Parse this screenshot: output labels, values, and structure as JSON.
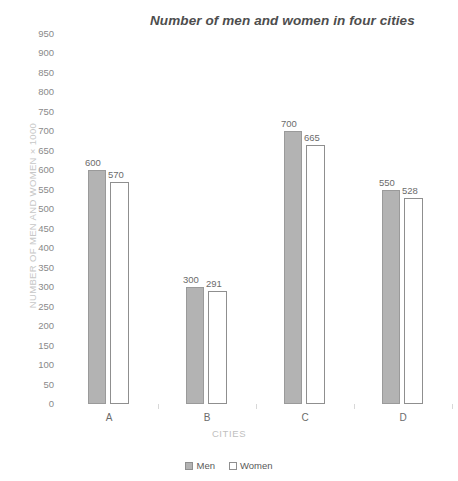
{
  "chart_data": {
    "type": "bar",
    "title": "Number of men and women in four cities",
    "xlabel": "CITIES",
    "ylabel": "NUMBER OF MEN AND WOMEN × 1000",
    "categories": [
      "A",
      "B",
      "C",
      "D"
    ],
    "series": [
      {
        "name": "Men",
        "values": [
          600,
          300,
          700,
          550
        ],
        "color": "#b3b3b3",
        "style": "filled"
      },
      {
        "name": "Women",
        "values": [
          570,
          291,
          665,
          528
        ],
        "color": "#ffffff",
        "style": "outline"
      }
    ],
    "ylim": [
      0,
      950
    ],
    "ytick_step": 50,
    "yticks": [
      0,
      50,
      100,
      150,
      200,
      250,
      300,
      350,
      400,
      450,
      500,
      550,
      600,
      650,
      700,
      750,
      800,
      850,
      900,
      950
    ],
    "ytick_labels": [
      "0",
      "50",
      "100",
      "150",
      "200",
      "250",
      "300",
      "350",
      "400",
      "450",
      "500",
      "550",
      "600",
      "650",
      "700",
      "750",
      "800",
      "850",
      "900",
      "950"
    ],
    "data_labels": {
      "A": {
        "Men": "600",
        "Women": "570"
      },
      "B": {
        "Men": "300",
        "Women": "291"
      },
      "C": {
        "Men": "700",
        "Women": "665"
      },
      "D": {
        "Men": "550",
        "Women": "528"
      }
    },
    "grid": false,
    "legend_position": "bottom-center",
    "legend_entries": [
      "Men",
      "Women"
    ],
    "colors": {
      "men_fill": "#b3b3b3",
      "men_border": "#9a9a9a",
      "women_fill": "#ffffff",
      "women_border": "#8f8f8f",
      "title_text": "#4d4d4d",
      "tick_text": "#8a8a8a",
      "axis_title_text": "#c0c0c0"
    }
  }
}
